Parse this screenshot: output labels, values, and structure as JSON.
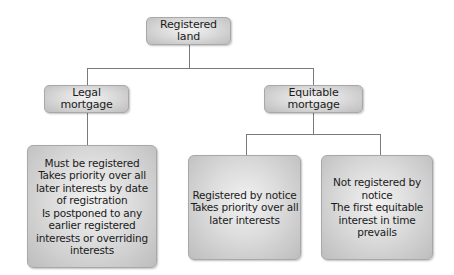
{
  "diagram": {
    "type": "tree",
    "root": {
      "label": "Registered land"
    },
    "branches": [
      {
        "label": "Legal mortgage",
        "leaves": [
          {
            "text": "Must be registered\nTakes priority over all\nlater interests by date\nof registration\nIs postponed to any\nearlier registered\ninterests or overriding\ninterests"
          }
        ]
      },
      {
        "label": "Equitable mortgage",
        "leaves": [
          {
            "text": "Registered by notice\nTakes priority over all\nlater interests"
          },
          {
            "text": "Not registered by\nnotice\nThe first equitable\ninterest in time prevails"
          }
        ]
      }
    ]
  }
}
